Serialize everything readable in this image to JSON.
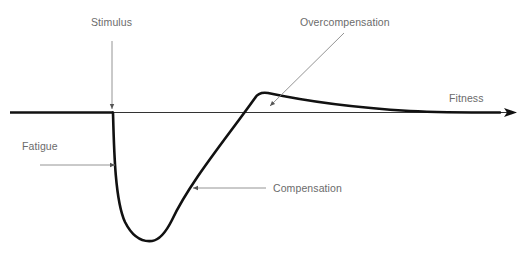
{
  "diagram": {
    "type": "supercompensation-curve",
    "labels": {
      "stimulus": "Stimulus",
      "overcompensation": "Overcompensation",
      "fitness": "Fitness",
      "fatigue": "Fatigue",
      "compensation": "Compensation"
    },
    "colors": {
      "curve": "#111111",
      "axis": "#333333",
      "pointer": "#777777",
      "label": "#6b6b6b",
      "background": "#ffffff"
    }
  }
}
